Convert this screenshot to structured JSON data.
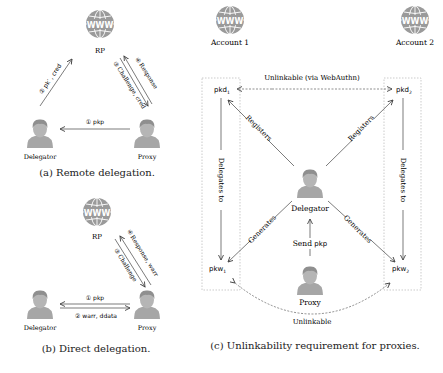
{
  "panel_a": {
    "caption": "(a) Remote delegation.",
    "rp_label": "RP",
    "globe_text": "WWW",
    "delegator_label": "Delegator",
    "proxy_label": "Proxy",
    "edge_delegator_rp": "② pk′ , cred",
    "edge_rp_proxy": "③ Challenge, cred",
    "edge_proxy_rp": "④ Response",
    "edge_proxy_delegator": "① pkp"
  },
  "panel_b": {
    "caption": "(b) Direct delegation.",
    "rp_label": "RP",
    "globe_text": "WWW",
    "delegator_label": "Delegator",
    "proxy_label": "Proxy",
    "edge_rp_proxy": "③ Challenge",
    "edge_proxy_rp": "④ Response, warr",
    "edge_proxy_delegator": "① pkp",
    "edge_delegator_proxy": "② warr, ddata"
  },
  "panel_c": {
    "caption": "(c) Unlinkability requirement for proxies.",
    "account1_label": "Account 1",
    "account2_label": "Account 2",
    "globe_text": "WWW",
    "pkd1": "pkd",
    "pkd1_sub": "1",
    "pkd2": "pkd",
    "pkd2_sub": "2",
    "pkw1": "pkw",
    "pkw1_sub": "1",
    "pkw2": "pkw",
    "pkw2_sub": "2",
    "top_link_label": "Unlinkable (via WebAuthn)",
    "bottom_link_label": "Unlinkable",
    "registers_left": "Registers",
    "registers_right": "Registers",
    "generates_left": "Generates",
    "generates_right": "Generates",
    "delegates_left": "Delegates to",
    "delegates_right": "Delegates to",
    "delegator_label": "Delegator",
    "send_label": "Send",
    "send_key": "pkp",
    "proxy_label": "Proxy"
  },
  "colors": {
    "icon_gray": "#9a9a9a",
    "icon_dark": "#8a8a8a",
    "line": "#444444",
    "box_border": "#aaaaaa"
  }
}
